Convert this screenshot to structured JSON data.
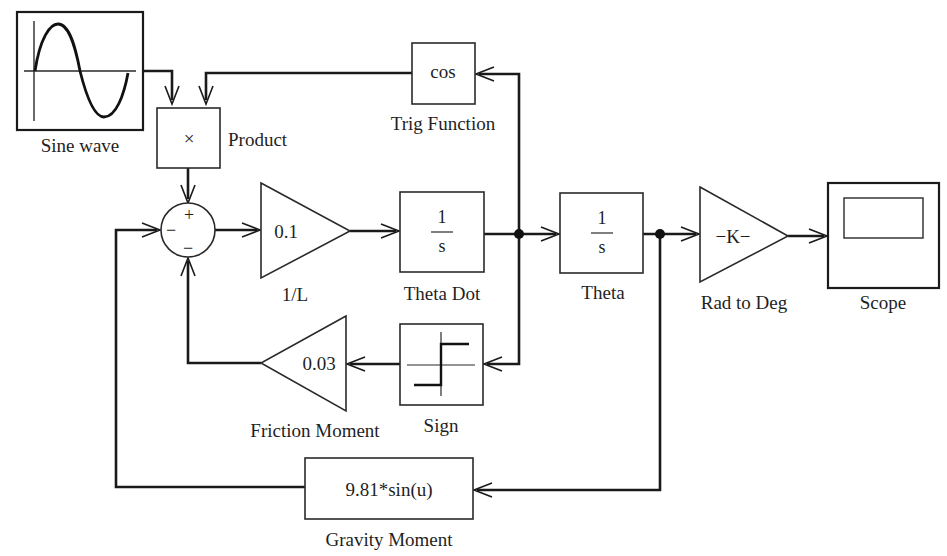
{
  "diagram": {
    "type": "simulink-block-diagram",
    "blocks": {
      "sine_wave": {
        "label": "Sine wave"
      },
      "product": {
        "label": "Product",
        "symbol": "×"
      },
      "sum": {
        "signs": {
          "top": "+",
          "left": "−",
          "bottom": "−"
        }
      },
      "gain_1L": {
        "label": "1/L",
        "value": "0.1"
      },
      "theta_dot": {
        "label": "Theta Dot",
        "numerator": "1",
        "denominator": "s"
      },
      "theta": {
        "label": "Theta",
        "numerator": "1",
        "denominator": "s"
      },
      "rad_to_deg": {
        "label": "Rad to Deg",
        "value": "−K−"
      },
      "scope": {
        "label": "Scope"
      },
      "trig_function": {
        "label": "Trig Function",
        "value": "cos"
      },
      "sign": {
        "label": "Sign"
      },
      "friction_moment": {
        "label": "Friction Moment",
        "value": "0.03"
      },
      "gravity_moment": {
        "label": "Gravity Moment",
        "value": "9.81*sin(u)"
      }
    },
    "connections": [
      {
        "from": "Sine wave",
        "to": "Product"
      },
      {
        "from": "Trig Function",
        "to": "Product"
      },
      {
        "from": "Product",
        "to": "Sum (+)"
      },
      {
        "from": "Sum",
        "to": "1/L"
      },
      {
        "from": "1/L",
        "to": "Theta Dot"
      },
      {
        "from": "Theta Dot",
        "to": "Theta"
      },
      {
        "from": "Theta Dot",
        "to": "Trig Function"
      },
      {
        "from": "Theta Dot",
        "to": "Sign"
      },
      {
        "from": "Sign",
        "to": "Friction Moment"
      },
      {
        "from": "Friction Moment",
        "to": "Sum (−, bottom)"
      },
      {
        "from": "Theta",
        "to": "Rad to Deg"
      },
      {
        "from": "Theta",
        "to": "Gravity Moment"
      },
      {
        "from": "Gravity Moment",
        "to": "Sum (−, left)"
      },
      {
        "from": "Rad to Deg",
        "to": "Scope"
      }
    ]
  }
}
